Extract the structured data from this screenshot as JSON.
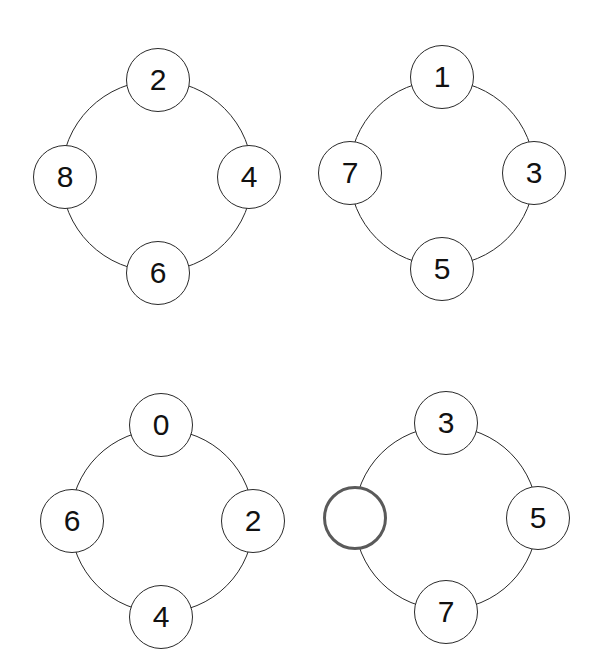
{
  "puzzles": [
    {
      "id": 1,
      "center": [
        157,
        176
      ],
      "radius": 96,
      "nodes": {
        "top": "2",
        "right": "4",
        "bottom": "6",
        "left": "8"
      }
    },
    {
      "id": 2,
      "center": [
        442,
        173
      ],
      "radius": 93,
      "nodes": {
        "top": "1",
        "right": "3",
        "bottom": "5",
        "left": "7"
      }
    },
    {
      "id": 3,
      "center": [
        162,
        521
      ],
      "radius": 92,
      "nodes": {
        "top": "0",
        "right": "2",
        "bottom": "4",
        "left": "6"
      }
    },
    {
      "id": 4,
      "center": [
        446,
        518
      ],
      "radius": 92,
      "nodes": {
        "top": "3",
        "right": "5",
        "bottom": "7",
        "left": ""
      }
    }
  ],
  "missing_node": {
    "puzzle": 4,
    "position": "left",
    "border_color": "#5a5a5a"
  }
}
